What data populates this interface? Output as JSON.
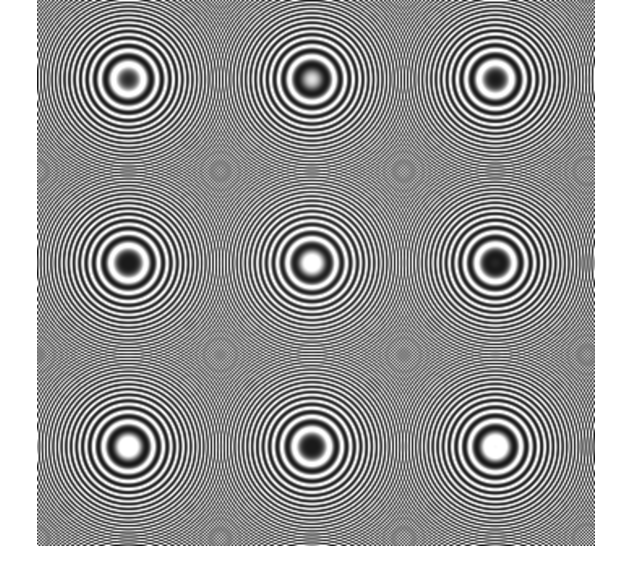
{
  "page": {
    "background_color": "#ffffff",
    "width": 622,
    "height": 582
  },
  "figure": {
    "name": "zone-plate-moire",
    "ink_color": "#000000",
    "paper_color": "#ffffff"
  },
  "chart_data": {
    "type": "heatmap",
    "title": "",
    "subtitle": "",
    "xlabel": "",
    "ylabel": "",
    "function": "0.5 + 0.5 * cos(k * r^2)",
    "colormap": "grayscale",
    "grid": false,
    "legend": false,
    "center_x": 312,
    "center_y": 263,
    "region": {
      "left": 37,
      "top": 0,
      "right": 595,
      "bottom": 546,
      "width": 558,
      "height": 546
    },
    "chirp_coefficient_k": 0.00168,
    "sample_step_px": 1.62,
    "gamma": 0.86,
    "contrast": 1.34,
    "blur_px": 0.7,
    "ring_radii_px": [
      6,
      13,
      19,
      24,
      29,
      34,
      38,
      42,
      46,
      50,
      54,
      57,
      61,
      64,
      67,
      70,
      73,
      76,
      79,
      82
    ],
    "xlim": [
      37,
      595
    ],
    "ylim": [
      0,
      546
    ],
    "value_range": [
      0,
      1
    ]
  }
}
